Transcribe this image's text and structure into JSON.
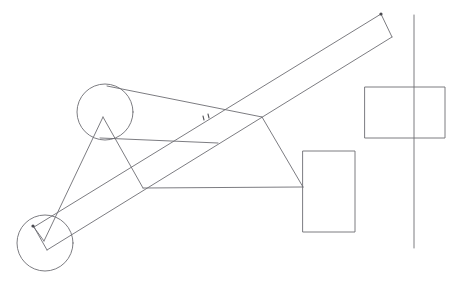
{
  "canvas": {
    "width": 455,
    "height": 284,
    "background": "#ffffff",
    "title": "hand-drawn mechanism sketch"
  },
  "style": {
    "line_color": "#6d6d73",
    "line_color_dark": "#5a5a60",
    "line_color_light": "#8a8a90",
    "node_color": "#4a4a50",
    "line_width": 0.9
  },
  "chart_data": {
    "type": "line",
    "title": "",
    "xlabel": "",
    "ylabel": "",
    "grid": false,
    "legend": null
  },
  "shapes": {
    "circles": [
      {
        "name": "upper-circle",
        "cx": 105,
        "cy": 112,
        "r": 28
      },
      {
        "name": "lower-circle",
        "cx": 45,
        "cy": 243,
        "r": 28
      }
    ],
    "rectangles": [
      {
        "name": "upper-right-rectangle",
        "x": 365,
        "y": 87,
        "width": 80,
        "height": 51
      },
      {
        "name": "lower-right-rectangle",
        "x": 303,
        "y": 151,
        "width": 52,
        "height": 81
      }
    ],
    "vertical_axis": {
      "name": "vertical-reference-line",
      "x": 414,
      "y1": 15,
      "y2": 248
    },
    "beam": {
      "name": "diagonal-beam",
      "top_left_corner": [
        381,
        14
      ],
      "top_right_corner": [
        392,
        37
      ],
      "bottom_right_corner": [
        47,
        250
      ],
      "bottom_left_corner": [
        34,
        227
      ],
      "edge_upper": [
        [
          381,
          14
        ],
        [
          34,
          227
        ]
      ],
      "edge_lower": [
        [
          392,
          37
        ],
        [
          47,
          250
        ]
      ],
      "cap_top": [
        [
          381,
          14
        ],
        [
          392,
          37
        ]
      ],
      "cap_bottom": [
        [
          34,
          227
        ],
        [
          47,
          250
        ]
      ]
    },
    "polylines": [
      {
        "name": "upper-chord-line",
        "points": [
          [
            107,
            86
          ],
          [
            262,
            117
          ]
        ]
      },
      {
        "name": "mid-horizontal-line",
        "points": [
          [
            100,
            138
          ],
          [
            218,
            143
          ]
        ]
      },
      {
        "name": "lower-horizontal-line",
        "points": [
          [
            143,
            188
          ],
          [
            303,
            187
          ]
        ]
      },
      {
        "name": "vertex-to-rect-line",
        "points": [
          [
            262,
            117
          ],
          [
            303,
            187
          ]
        ]
      },
      {
        "name": "triangle-left-leg",
        "points": [
          [
            103,
            117
          ],
          [
            44,
            241
          ]
        ]
      },
      {
        "name": "triangle-right-leg",
        "points": [
          [
            103,
            117
          ],
          [
            143,
            188
          ]
        ]
      },
      {
        "name": "lower-circle-chord",
        "points": [
          [
            33,
            226
          ],
          [
            44,
            241
          ]
        ]
      }
    ],
    "nodes": [
      {
        "name": "beam-top-node",
        "cx": 381,
        "cy": 14,
        "r": 1.6
      },
      {
        "name": "beam-bottom-node",
        "cx": 33,
        "cy": 226,
        "r": 1.6
      }
    ],
    "annotation_marks": {
      "name": "beam-hatch-marks",
      "marks": [
        {
          "x1": 203,
          "y1": 116,
          "x2": 204,
          "y2": 120
        },
        {
          "x1": 208,
          "y1": 114,
          "x2": 209,
          "y2": 118
        }
      ]
    }
  }
}
